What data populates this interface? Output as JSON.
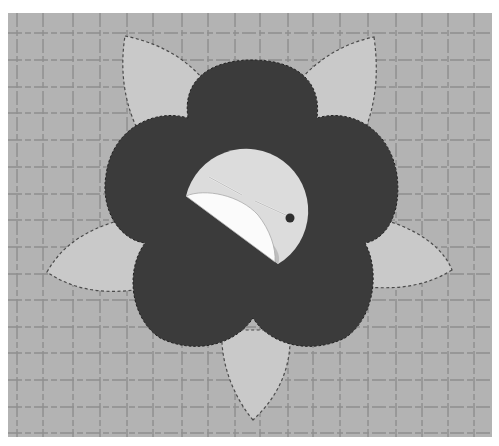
{
  "image": {
    "description": "Photograph of a fabric flower appliqué on a gridded cutting mat: dark five-lobed flower with five light dashed-stitched petals behind it, and a light circle in the center showing a folded-back white fabric edge held with a straight pin.",
    "alt": "Fabric flower appliqué with pin"
  },
  "colors": {
    "page_bg": "#ffffff",
    "mat": "#b3b3b3",
    "grid_line": "#8e8e8e",
    "petal": "#c9c9c9",
    "stitch": "#4a4a4a",
    "flower": "#3b3b3b",
    "center_circle": "#dcdcdc",
    "fold": "#fbfbfb",
    "pin_head": "#2e2e2e"
  },
  "grid": {
    "x_lines": [
      17,
      43,
      73,
      100,
      127,
      153,
      182,
      208,
      235,
      260,
      288,
      313,
      340,
      368,
      396,
      422,
      448,
      474
    ],
    "y_lines": [
      33,
      60,
      87,
      113,
      140,
      167,
      194,
      220,
      247,
      274,
      300,
      327,
      353,
      380,
      407,
      433
    ]
  }
}
